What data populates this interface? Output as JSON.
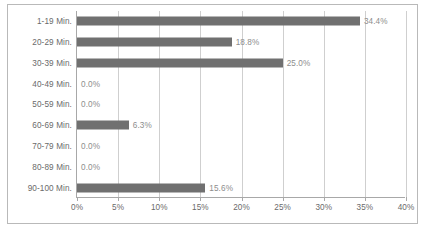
{
  "chart_data": {
    "type": "bar",
    "orientation": "horizontal",
    "title": "",
    "subtitle": "",
    "xlabel": "",
    "ylabel": "",
    "grid": true,
    "legend": false,
    "xlim": [
      0,
      40
    ],
    "xtick_labels": [
      "0%",
      "5%",
      "10%",
      "15%",
      "20%",
      "25%",
      "30%",
      "35%",
      "40%"
    ],
    "xtick_values": [
      0,
      5,
      10,
      15,
      20,
      25,
      30,
      35,
      40
    ],
    "categories": [
      "1-19 Min.",
      "20-29 Min.",
      "30-39 Min.",
      "40-49 Min.",
      "50-59 Min.",
      "60-69 Min.",
      "70-79 Min.",
      "80-89 Min.",
      "90-100 Min."
    ],
    "values": [
      34.4,
      18.8,
      25.0,
      0.0,
      0.0,
      6.3,
      0.0,
      0.0,
      15.6
    ],
    "value_labels": [
      "34.4%",
      "18.8%",
      "25.0%",
      "0.0%",
      "0.0%",
      "6.3%",
      "0.0%",
      "0.0%",
      "15.6%"
    ],
    "colors": {
      "bar": "#707070",
      "grid": "#cfcfcf",
      "axis": "#a8a8a8",
      "frame": "#b9b9b9",
      "label_text": "#6a6a6a",
      "value_text": "#8d8d8d",
      "background": "#ffffff"
    }
  }
}
